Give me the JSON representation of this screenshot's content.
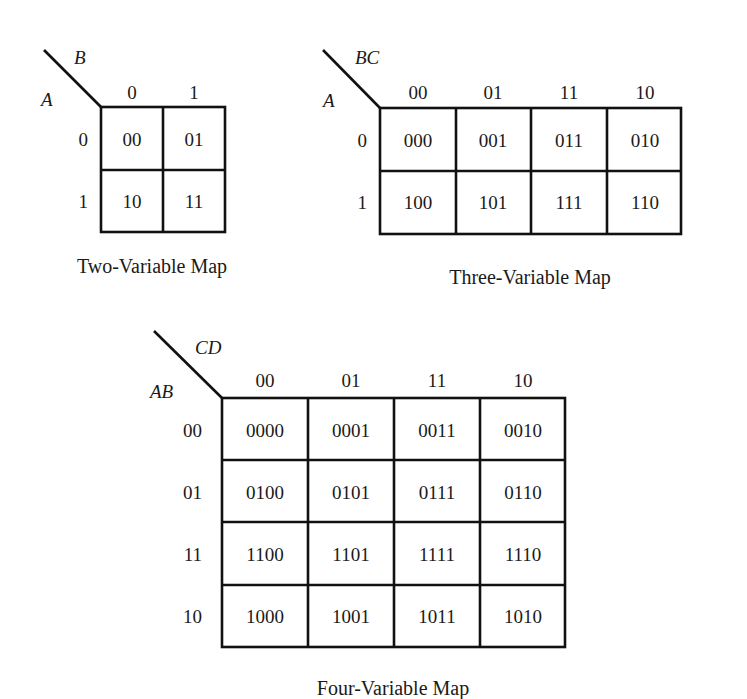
{
  "maps": [
    {
      "id": "two-variable",
      "caption": "Two-Variable Map",
      "row_var": "A",
      "col_var": "B",
      "col_labels": [
        "0",
        "1"
      ],
      "row_labels": [
        "0",
        "1"
      ],
      "cells": [
        [
          "00",
          "01"
        ],
        [
          "10",
          "11"
        ]
      ]
    },
    {
      "id": "three-variable",
      "caption": "Three-Variable Map",
      "row_var": "A",
      "col_var": "BC",
      "col_labels": [
        "00",
        "01",
        "11",
        "10"
      ],
      "row_labels": [
        "0",
        "1"
      ],
      "cells": [
        [
          "000",
          "001",
          "011",
          "010"
        ],
        [
          "100",
          "101",
          "111",
          "110"
        ]
      ]
    },
    {
      "id": "four-variable",
      "caption": "Four-Variable Map",
      "row_var": "AB",
      "col_var": "CD",
      "col_labels": [
        "00",
        "01",
        "11",
        "10"
      ],
      "row_labels": [
        "00",
        "01",
        "11",
        "10"
      ],
      "cells": [
        [
          "0000",
          "0001",
          "0011",
          "0010"
        ],
        [
          "0100",
          "0101",
          "0111",
          "0110"
        ],
        [
          "1100",
          "1101",
          "1111",
          "1110"
        ],
        [
          "1000",
          "1001",
          "1011",
          "1010"
        ]
      ]
    }
  ]
}
